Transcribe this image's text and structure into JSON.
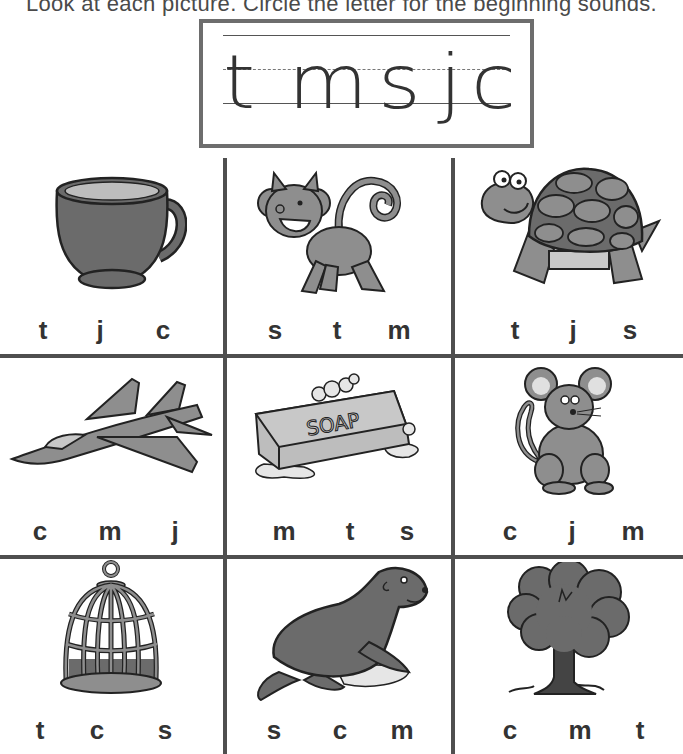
{
  "instructions": "Look at each picture. Circle the letter for the beginning sounds.",
  "letter_box": {
    "letters": [
      "t",
      "m",
      "s",
      "j",
      "c"
    ]
  },
  "grid": {
    "cells": [
      {
        "picture": "cup",
        "choices": [
          "t",
          "j",
          "c"
        ]
      },
      {
        "picture": "monkey",
        "choices": [
          "s",
          "t",
          "m"
        ]
      },
      {
        "picture": "turtle",
        "choices": [
          "t",
          "j",
          "s"
        ]
      },
      {
        "picture": "jet",
        "choices": [
          "c",
          "m",
          "j"
        ]
      },
      {
        "picture": "soap",
        "label": "SOAP",
        "choices": [
          "m",
          "t",
          "s"
        ]
      },
      {
        "picture": "mouse",
        "choices": [
          "c",
          "j",
          "m"
        ]
      },
      {
        "picture": "cage",
        "choices": [
          "t",
          "c",
          "s"
        ]
      },
      {
        "picture": "seal",
        "choices": [
          "s",
          "c",
          "m"
        ]
      },
      {
        "picture": "tree",
        "choices": [
          "c",
          "m",
          "t"
        ]
      }
    ]
  },
  "colors": {
    "grid_line": "#4f4f4f",
    "fill_dark": "#6b6b6b",
    "fill_mid": "#8e8e8e",
    "fill_light": "#c8c8c8"
  }
}
